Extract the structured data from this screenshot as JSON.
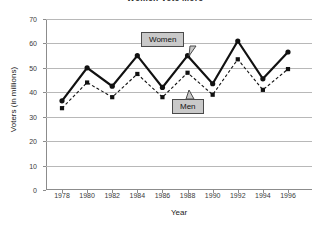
{
  "chart_data": {
    "type": "line",
    "title": "Women Vote More",
    "xlabel": "Year",
    "ylabel": "Voters (in millions)",
    "categories": [
      1978,
      1980,
      1982,
      1984,
      1986,
      1988,
      1990,
      1992,
      1994,
      1996
    ],
    "x_tick_labels": [
      "1978",
      "1980",
      "1982",
      "1984",
      "1986",
      "1988",
      "1990",
      "1992",
      "1994",
      "1996"
    ],
    "y_tick_labels": [
      "0",
      "10",
      "20",
      "30",
      "40",
      "50",
      "60",
      "70"
    ],
    "y_ticks": [
      0,
      10,
      20,
      30,
      40,
      50,
      60,
      70
    ],
    "ylim": [
      0,
      70
    ],
    "grid": "horizontal",
    "legend_position": "inline-callouts",
    "series": [
      {
        "name": "Women",
        "style": "solid",
        "color": "#111111",
        "marker": "circle",
        "values": [
          36.5,
          50.0,
          42.5,
          55.0,
          42.0,
          55.0,
          43.5,
          61.0,
          45.5,
          56.5
        ]
      },
      {
        "name": "Men",
        "style": "dashed",
        "color": "#111111",
        "marker": "square",
        "values": [
          33.5,
          44.0,
          38.0,
          47.5,
          38.0,
          48.0,
          39.0,
          53.5,
          41.0,
          49.5
        ]
      }
    ],
    "annotations": [
      {
        "label": "Women",
        "target_year": 1988,
        "target_series": "Women"
      },
      {
        "label": "Men",
        "target_year": 1988,
        "target_series": "Men"
      }
    ]
  },
  "colors": {
    "gridline": "#b8b8b8",
    "axis": "#8c8c8c",
    "series": "#111111",
    "callout_bg": "#c9c9c9",
    "callout_border": "#4a4a4a",
    "background": "#ffffff"
  }
}
